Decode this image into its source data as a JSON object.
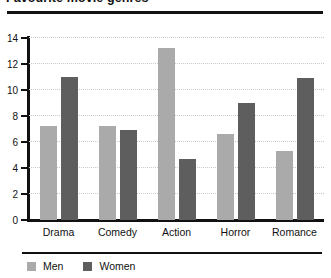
{
  "chart_data": {
    "type": "bar",
    "title": "Favourite movie genres",
    "xlabel": "",
    "ylabel": "",
    "categories": [
      "Drama",
      "Comedy",
      "Action",
      "Horror",
      "Romance"
    ],
    "series": [
      {
        "name": "Men",
        "color": "#aaaaaa",
        "values": [
          7.2,
          7.2,
          13.2,
          6.6,
          5.3
        ]
      },
      {
        "name": "Women",
        "color": "#5e5e5e",
        "values": [
          11.0,
          6.9,
          4.7,
          9.0,
          10.9
        ]
      }
    ],
    "ylim": [
      0,
      14
    ],
    "yticks": [
      0,
      2,
      4,
      6,
      8,
      10,
      12,
      14
    ],
    "ytick_labels": [
      "0",
      "2",
      "4",
      "6",
      "8",
      "10",
      "12",
      "14"
    ],
    "grid": true,
    "legend_position": "bottom-left"
  },
  "legend": {
    "items": [
      {
        "label": "Men",
        "swatch": "men"
      },
      {
        "label": "Women",
        "swatch": "women"
      }
    ]
  }
}
